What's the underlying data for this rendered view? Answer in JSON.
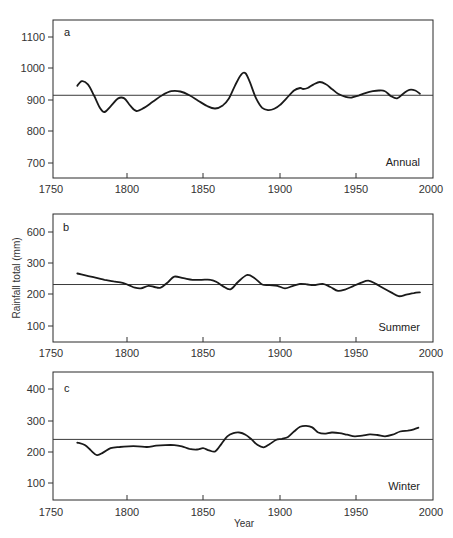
{
  "chart_data": [
    {
      "type": "line",
      "panel": "a",
      "title": "Annual",
      "xlabel": "",
      "ylabel": "Rainfall total (mm)",
      "xlim": [
        1750,
        2000
      ],
      "ylim": [
        650,
        1150
      ],
      "x_ticks": [
        1750,
        1800,
        1850,
        1900,
        1950,
        2000
      ],
      "y_ticks": [
        700,
        800,
        900,
        1000,
        1100
      ],
      "mean_line": 915,
      "series": [
        {
          "name": "Annual",
          "x": [
            1766,
            1769,
            1773,
            1777,
            1781,
            1784,
            1788,
            1793,
            1797,
            1801,
            1805,
            1810,
            1816,
            1822,
            1828,
            1834,
            1840,
            1846,
            1852,
            1857,
            1862,
            1866,
            1870,
            1874,
            1877,
            1880,
            1884,
            1888,
            1892,
            1896,
            1900,
            1904,
            1909,
            1913,
            1915,
            1918,
            1922,
            1926,
            1930,
            1934,
            1938,
            1943,
            1947,
            1952,
            1956,
            1961,
            1965,
            1969,
            1973,
            1977,
            1981,
            1985,
            1989,
            1992
          ],
          "y": [
            945,
            960,
            950,
            915,
            875,
            862,
            880,
            905,
            905,
            882,
            865,
            875,
            895,
            915,
            928,
            927,
            915,
            897,
            880,
            873,
            883,
            905,
            945,
            980,
            985,
            955,
            905,
            875,
            868,
            872,
            885,
            905,
            930,
            938,
            935,
            938,
            950,
            957,
            950,
            935,
            920,
            910,
            908,
            915,
            922,
            928,
            930,
            928,
            912,
            905,
            920,
            932,
            930,
            920
          ]
        }
      ]
    },
    {
      "type": "line",
      "panel": "b",
      "title": "Summer",
      "xlabel": "",
      "ylabel": "Rainfall total (mm)",
      "xlim": [
        1750,
        2000
      ],
      "ylim": [
        50,
        650
      ],
      "x_ticks": [
        1750,
        1800,
        1850,
        1900,
        1950,
        2000
      ],
      "y_ticks": [
        100,
        200,
        300,
        600
      ],
      "mean_line": 230,
      "series": [
        {
          "name": "Summer",
          "x": [
            1766,
            1772,
            1778,
            1784,
            1790,
            1796,
            1800,
            1804,
            1808,
            1813,
            1817,
            1821,
            1826,
            1830,
            1836,
            1842,
            1848,
            1854,
            1858,
            1862,
            1867,
            1872,
            1878,
            1883,
            1888,
            1893,
            1898,
            1903,
            1908,
            1913,
            1918,
            1922,
            1928,
            1933,
            1938,
            1943,
            1948,
            1953,
            1958,
            1963,
            1968,
            1973,
            1978,
            1983,
            1988,
            1992
          ],
          "y": [
            265,
            258,
            252,
            245,
            240,
            235,
            228,
            220,
            218,
            226,
            222,
            220,
            238,
            255,
            250,
            245,
            245,
            245,
            238,
            225,
            215,
            238,
            260,
            250,
            230,
            228,
            226,
            218,
            225,
            232,
            230,
            228,
            232,
            222,
            210,
            215,
            225,
            235,
            242,
            232,
            218,
            205,
            193,
            198,
            203,
            205
          ]
        }
      ]
    },
    {
      "type": "line",
      "panel": "c",
      "title": "Winter",
      "xlabel": "Year",
      "ylabel": "Rainfall total (mm)",
      "xlim": [
        1750,
        2000
      ],
      "ylim": [
        50,
        450
      ],
      "x_ticks": [
        1750,
        1800,
        1850,
        1900,
        1950,
        2000
      ],
      "y_ticks": [
        100,
        200,
        300,
        400
      ],
      "mean_line": 240,
      "series": [
        {
          "name": "Winter",
          "x": [
            1766,
            1771,
            1775,
            1779,
            1783,
            1788,
            1794,
            1800,
            1806,
            1812,
            1818,
            1824,
            1830,
            1835,
            1840,
            1845,
            1849,
            1853,
            1857,
            1861,
            1865,
            1869,
            1873,
            1877,
            1881,
            1885,
            1889,
            1893,
            1897,
            1901,
            1905,
            1909,
            1913,
            1917,
            1921,
            1925,
            1929,
            1934,
            1939,
            1944,
            1949,
            1954,
            1959,
            1964,
            1969,
            1974,
            1979,
            1984,
            1988,
            1991
          ],
          "y": [
            230,
            222,
            205,
            190,
            198,
            212,
            216,
            218,
            218,
            216,
            220,
            222,
            222,
            218,
            210,
            208,
            212,
            205,
            202,
            225,
            250,
            260,
            262,
            255,
            240,
            222,
            215,
            225,
            238,
            242,
            248,
            265,
            280,
            283,
            278,
            262,
            258,
            262,
            260,
            255,
            250,
            252,
            256,
            254,
            250,
            255,
            265,
            268,
            272,
            277
          ]
        }
      ]
    }
  ],
  "labels": {
    "panel_a": "a",
    "panel_b": "b",
    "panel_c": "c",
    "season_a": "Annual",
    "season_b": "Summer",
    "season_c": "Winter",
    "y_axis_title": "Rainfall total (mm)",
    "x_axis_title": "Year"
  },
  "ticks": {
    "x": [
      "1750",
      "1800",
      "1850",
      "1900",
      "1950",
      "2000"
    ],
    "a_y": [
      "1100",
      "1000",
      "900",
      "800",
      "700"
    ],
    "b_y": [
      "600",
      "300",
      "200",
      "100"
    ],
    "c_y": [
      "400",
      "300",
      "200",
      "100"
    ]
  },
  "colors": {
    "line": "#1a1a1a",
    "mean": "#3a3a3a",
    "frame": "#2a2a2a"
  }
}
